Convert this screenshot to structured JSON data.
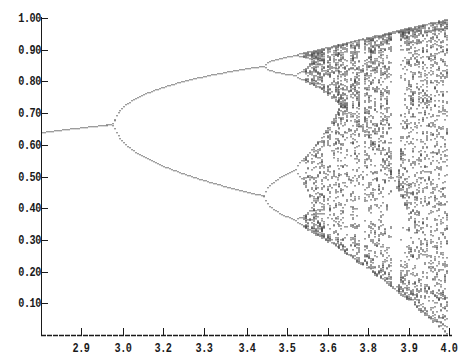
{
  "chart_data": {
    "type": "scatter",
    "title": "",
    "xlabel": "",
    "ylabel": "",
    "model": {
      "r_start": 2.78,
      "r_end": 4.0,
      "r_steps": 205,
      "transient_iterations": 300,
      "plotted_iterations_per_r": 60,
      "x0": 0.5
    },
    "key_points": [
      {
        "r": 2.8,
        "x": [
          0.64
        ]
      },
      {
        "r": 2.9,
        "x": [
          0.655
        ]
      },
      {
        "r": 3.0,
        "x": [
          0.667
        ]
      },
      {
        "r": 3.2,
        "x": [
          0.513,
          0.799
        ]
      },
      {
        "r": 3.4,
        "x": [
          0.452,
          0.842
        ]
      },
      {
        "r": 3.45,
        "x": [
          0.44,
          0.85
        ]
      },
      {
        "r": 3.5,
        "x": [
          0.383,
          0.501,
          0.827,
          0.875
        ]
      },
      {
        "r": 4.0,
        "x_range": [
          0.0,
          1.0
        ]
      }
    ],
    "xlim": [
      2.78,
      4.0
    ],
    "ylim": [
      0.0,
      1.0
    ],
    "x_ticks": [
      {
        "label": "2.9",
        "px": 81
      },
      {
        "label": "3.0",
        "px": 123
      },
      {
        "label": "3.2",
        "px": 163
      },
      {
        "label": "3.3",
        "px": 204
      },
      {
        "label": "3.4",
        "px": 247
      },
      {
        "label": "3.5",
        "px": 287
      },
      {
        "label": "3.6",
        "px": 328
      },
      {
        "label": "3.8",
        "px": 368
      },
      {
        "label": "3.9",
        "px": 409
      },
      {
        "label": "4.0",
        "px": 449
      }
    ],
    "y_ticks": [
      {
        "label": "1.00",
        "value": 1.0
      },
      {
        "label": "0.90",
        "value": 0.9
      },
      {
        "label": "0.80",
        "value": 0.8
      },
      {
        "label": "0.70",
        "value": 0.7
      },
      {
        "label": "0.60",
        "value": 0.6
      },
      {
        "label": "0.50",
        "value": 0.5
      },
      {
        "label": "0.40",
        "value": 0.4
      },
      {
        "label": "0.30",
        "value": 0.3
      },
      {
        "label": "0.20",
        "value": 0.2
      },
      {
        "label": "0.10",
        "value": 0.1
      }
    ],
    "grid": false,
    "legend": null,
    "colors": {
      "ink": "#1a1a1a",
      "background": "#ffffff"
    }
  }
}
